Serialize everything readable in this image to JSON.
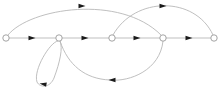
{
  "diagram": {
    "type": "directed-graph",
    "colors": {
      "edge": "#b8b8b8",
      "node_stroke": "#9a9a9a",
      "node_fill": "#ffffff",
      "arrow": "#1a1a1a",
      "background": "#ffffff"
    },
    "nodes": [
      {
        "id": "n1",
        "x": 6,
        "y": 38,
        "r": 3.2
      },
      {
        "id": "n2",
        "x": 59,
        "y": 38,
        "r": 3.2
      },
      {
        "id": "n3",
        "x": 112,
        "y": 38,
        "r": 3.2
      },
      {
        "id": "n4",
        "x": 163,
        "y": 38,
        "r": 3.2
      },
      {
        "id": "n5",
        "x": 214,
        "y": 38,
        "r": 3.2
      }
    ],
    "edges": [
      {
        "id": "e12",
        "from": "n1",
        "to": "n2",
        "kind": "straight",
        "path": "M 9 38 L 56 38",
        "arrow": {
          "x": 32,
          "y": 38,
          "angle": 0
        }
      },
      {
        "id": "e23",
        "from": "n2",
        "to": "n3",
        "kind": "straight",
        "path": "M 62 38 L 109 38",
        "arrow": {
          "x": 85,
          "y": 38,
          "angle": 0
        }
      },
      {
        "id": "e34",
        "from": "n3",
        "to": "n4",
        "kind": "straight",
        "path": "M 115 38 L 160 38",
        "arrow": {
          "x": 137,
          "y": 38,
          "angle": 0
        }
      },
      {
        "id": "e45",
        "from": "n4",
        "to": "n5",
        "kind": "straight",
        "path": "M 166 38 L 211 38",
        "arrow": {
          "x": 189,
          "y": 38,
          "angle": 0
        }
      },
      {
        "id": "e14",
        "from": "n1",
        "to": "n4",
        "kind": "arc-upper",
        "path": "M 8 35 C 30 8, 120 -6, 161 35",
        "arrow": {
          "x": 82,
          "y": 6,
          "angle": 0
        }
      },
      {
        "id": "e35",
        "from": "n3",
        "to": "n5",
        "kind": "arc-upper",
        "path": "M 113 35 C 135 -4, 195 -4, 213 35",
        "arrow": {
          "x": 163,
          "y": 6,
          "angle": 0
        }
      },
      {
        "id": "e42",
        "from": "n4",
        "to": "n2",
        "kind": "arc-lower",
        "path": "M 163 41 C 160 70, 130 82, 110 80 C 85 79, 68 65, 60 41",
        "arrow": {
          "x": 112,
          "y": 80,
          "angle": 180
        }
      },
      {
        "id": "e22",
        "from": "n2",
        "to": "n2",
        "kind": "self-loop",
        "path": "M 58 41 C 50 42, 33 70, 37 82 C 40 88, 50 88, 54 78 C 60 62, 63 48, 60 41",
        "arrow": {
          "x": 43,
          "y": 84,
          "angle": 190
        }
      }
    ]
  }
}
